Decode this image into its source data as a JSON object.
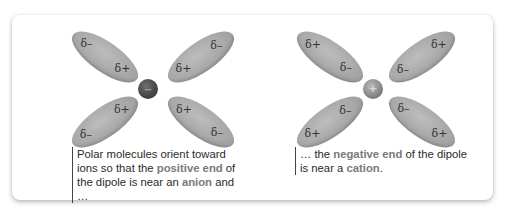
{
  "colors": {
    "highlight_text": "#7a7a7a",
    "body_text": "#2b2b2b",
    "dipole_fill": "#a8a8a8",
    "anion_fill": "#4a4a4a",
    "cation_fill": "#8a8a8a"
  },
  "left_panel": {
    "ion": {
      "type": "anion",
      "symbol": "–"
    },
    "dipoles": [
      {
        "position": "top-left",
        "outer": "δ–",
        "inner": "δ+"
      },
      {
        "position": "top-right",
        "outer": "δ–",
        "inner": "δ+"
      },
      {
        "position": "bottom-left",
        "outer": "δ–",
        "inner": "δ+"
      },
      {
        "position": "bottom-right",
        "outer": "δ–",
        "inner": "δ+"
      }
    ],
    "caption": {
      "part1": "Polar molecules orient toward ions so that the ",
      "hl1": "positive end",
      "part2": " of the dipole is near an ",
      "hl2": "anion",
      "part3": " and …"
    }
  },
  "right_panel": {
    "ion": {
      "type": "cation",
      "symbol": "+"
    },
    "dipoles": [
      {
        "position": "top-left",
        "outer": "δ+",
        "inner": "δ–"
      },
      {
        "position": "top-right",
        "outer": "δ+",
        "inner": "δ–"
      },
      {
        "position": "bottom-left",
        "outer": "δ+",
        "inner": "δ–"
      },
      {
        "position": "bottom-right",
        "outer": "δ+",
        "inner": "δ–"
      }
    ],
    "caption": {
      "part1": "… the ",
      "hl1": "negative end",
      "part2": " of the dipole is near a ",
      "hl2": "cation",
      "part3": "."
    }
  }
}
